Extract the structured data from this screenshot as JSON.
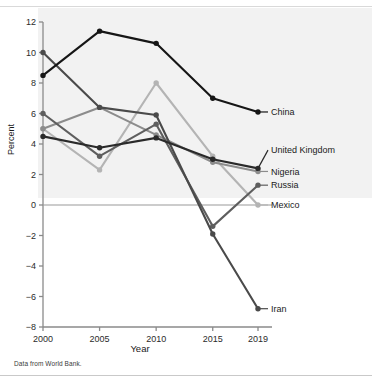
{
  "figure": {
    "footer_note": "Data from World Bank.",
    "y_axis_title": "Percent",
    "x_axis_title": "Year"
  },
  "chart_data": {
    "type": "line",
    "title": "",
    "xlabel": "Year",
    "ylabel": "Percent",
    "categories": [
      "2000",
      "2005",
      "2010",
      "2015",
      "2019"
    ],
    "x": [
      2000,
      2005,
      2010,
      2015,
      2019
    ],
    "xlim": [
      2000,
      2019
    ],
    "ylim": [
      -8,
      12
    ],
    "yticks": [
      -8,
      -6,
      -4,
      -2,
      0,
      2,
      4,
      6,
      8,
      10,
      12
    ],
    "ytick_labels": [
      "−8",
      "−6",
      "−4",
      "−2",
      "0",
      "2",
      "4",
      "6",
      "8",
      "10",
      "12"
    ],
    "xticks": [
      2000,
      2005,
      2010,
      2015,
      2019
    ],
    "xtick_labels": [
      "2000",
      "2005",
      "2010",
      "2015",
      "2019"
    ],
    "grid": false,
    "legend_position": "right-inline",
    "zero_line": true,
    "markers": "filled-circle",
    "series": [
      {
        "name": "China",
        "color": "#161616",
        "values": [
          8.5,
          11.4,
          10.6,
          7.0,
          6.1
        ],
        "label": "China",
        "label_y": 6.1
      },
      {
        "name": "Iran",
        "color": "#4a4a4a",
        "values": [
          10.0,
          6.4,
          5.9,
          -1.9,
          -6.8
        ],
        "label": "Iran",
        "label_y": -6.8
      },
      {
        "name": "Russia",
        "color": "#5e5e5e",
        "values": [
          6.0,
          3.2,
          5.3,
          -1.4,
          1.3
        ],
        "label": "Russia",
        "label_y": 1.3
      },
      {
        "name": "Nigeria",
        "color": "#8c8c8c",
        "values": [
          5.0,
          6.4,
          4.6,
          2.8,
          2.2
        ],
        "label": "Nigeria",
        "label_y": 2.2
      },
      {
        "name": "United Kingdom",
        "color": "#2a2a2a",
        "values": [
          4.5,
          3.75,
          4.4,
          3.0,
          2.4
        ],
        "label": "United Kingdom",
        "label_y": 3.6
      },
      {
        "name": "Mexico",
        "color": "#b4b4b4",
        "values": [
          5.0,
          2.3,
          8.0,
          3.2,
          0.0
        ],
        "label": "Mexico",
        "label_y": 0.0
      }
    ]
  }
}
